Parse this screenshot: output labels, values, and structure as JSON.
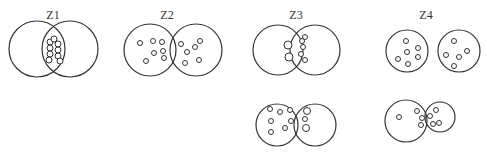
{
  "panels": [
    {
      "id": "z1",
      "label": "Z1",
      "description": "two cells fused with vesicles clustered at contact zone"
    },
    {
      "id": "z2",
      "label": "Z2",
      "description": "two adjacent cells with vesicles scattered inside"
    },
    {
      "id": "z3",
      "label": "Z3",
      "description": "two cells with vesicles at boundary (top) and larger vesicles at boundary (bottom)"
    },
    {
      "id": "z4",
      "label": "Z4",
      "description": "two separate cells with scattered vesicles (top) and overlapping cells with vesicles at junction (bottom)"
    }
  ]
}
